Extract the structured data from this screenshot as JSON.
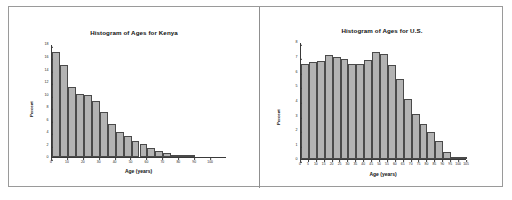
{
  "figure": {
    "panel_count": 2,
    "bar_fill_color": "#b3b3b3",
    "bar_edge_color": "#4a4a4a",
    "frame_color": "#9a9a9a"
  },
  "chart_data": [
    {
      "type": "bar",
      "id": "kenya",
      "title": "Histogram of Ages for Kenya",
      "xlabel": "Age (years)",
      "ylabel": "Percent",
      "xlim": [
        0,
        110
      ],
      "ylim": [
        0,
        18
      ],
      "grid": false,
      "legend": null,
      "bin_width": 5,
      "xticks": [
        0,
        10,
        20,
        30,
        40,
        50,
        60,
        70,
        80,
        90,
        100
      ],
      "xtick_labels": [
        "0",
        "10",
        "20",
        "30",
        "40",
        "50",
        "60",
        "70",
        "80",
        "90",
        "100"
      ],
      "yticks": [
        0,
        2,
        4,
        6,
        8,
        10,
        12,
        14,
        16,
        18
      ],
      "ytick_labels": [
        "0",
        "2",
        "4",
        "6",
        "8",
        "10",
        "12",
        "14",
        "16",
        "18"
      ],
      "bin_starts": [
        0,
        5,
        10,
        15,
        20,
        25,
        30,
        35,
        40,
        45,
        50,
        55,
        60,
        65,
        70,
        75,
        80,
        85
      ],
      "values": [
        16.8,
        14.7,
        11.2,
        10.1,
        9.8,
        9.0,
        7.2,
        5.2,
        4.0,
        3.3,
        2.6,
        2.1,
        1.4,
        1.0,
        0.7,
        0.4,
        0.2,
        0.1
      ]
    },
    {
      "type": "bar",
      "id": "us",
      "title": "Histogram of Ages for U.S.",
      "xlabel": "Age (years)",
      "ylabel": "Percent",
      "xlim": [
        0,
        105
      ],
      "ylim": [
        0,
        8
      ],
      "grid": false,
      "legend": null,
      "bin_width": 5,
      "xticks": [
        0,
        5,
        10,
        15,
        20,
        25,
        30,
        35,
        40,
        45,
        50,
        55,
        60,
        65,
        70,
        75,
        80,
        85,
        90,
        95,
        100,
        105
      ],
      "xtick_labels": [
        "0",
        "5",
        "10",
        "15",
        "20",
        "25",
        "30",
        "35",
        "40",
        "45",
        "50",
        "55",
        "60",
        "65",
        "70",
        "75",
        "80",
        "85",
        "90",
        "95",
        "100",
        "105"
      ],
      "yticks": [
        0,
        1,
        2,
        3,
        4,
        5,
        6,
        7,
        8
      ],
      "ytick_labels": [
        "0",
        "1",
        "2",
        "3",
        "4",
        "5",
        "6",
        "7",
        "8"
      ],
      "bin_starts": [
        0,
        5,
        10,
        15,
        20,
        25,
        30,
        35,
        40,
        45,
        50,
        55,
        60,
        65,
        70,
        75,
        80,
        85,
        90,
        95,
        100
      ],
      "values": [
        6.5,
        6.6,
        6.7,
        7.1,
        7.0,
        6.85,
        6.5,
        6.5,
        6.75,
        7.3,
        7.2,
        6.4,
        5.5,
        4.1,
        3.05,
        2.4,
        1.85,
        1.2,
        0.45,
        0.12,
        0.04
      ]
    }
  ]
}
